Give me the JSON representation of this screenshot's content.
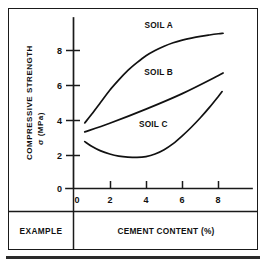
{
  "figure": {
    "caption_cell": "EXAMPLE",
    "border_color": "#1a1a1a",
    "line_color": "#111111",
    "background_color": "#ffffff"
  },
  "chart_data": {
    "type": "line",
    "title": "",
    "xlabel": "CEMENT CONTENT (%)",
    "ylabel": "COMPRESSIVE STRENGTH",
    "ylabel_symbol": "σ (MPa)",
    "xlim": [
      0,
      9.3
    ],
    "ylim": [
      0,
      9.7
    ],
    "xticks": [
      0,
      2,
      4,
      6,
      8
    ],
    "xtick_labels": [
      "0",
      "2",
      "4",
      "6",
      "8"
    ],
    "yticks": [
      0,
      2,
      4,
      6,
      8
    ],
    "ytick_labels": [
      "0",
      "2",
      "4",
      "6",
      "8"
    ],
    "grid": false,
    "legend_position": "inline-annotations",
    "series": [
      {
        "name": "SOIL A",
        "label": "SOIL A",
        "label_x": 4.7,
        "label_y": 9.3,
        "x": [
          0.62,
          1.0,
          1.5,
          2.0,
          2.5,
          3.0,
          3.5,
          4.0,
          4.5,
          5.0,
          5.5,
          6.0,
          6.5,
          7.0,
          7.5,
          8.0,
          8.25
        ],
        "y": [
          3.8,
          4.3,
          5.0,
          5.7,
          6.3,
          6.85,
          7.3,
          7.7,
          8.0,
          8.25,
          8.45,
          8.6,
          8.72,
          8.82,
          8.9,
          8.97,
          9.0
        ]
      },
      {
        "name": "SOIL B",
        "label": "SOIL B",
        "label_x": 4.7,
        "label_y": 6.6,
        "x": [
          0.62,
          2.0,
          4.0,
          6.0,
          8.0,
          8.25
        ],
        "y": [
          3.28,
          3.78,
          4.6,
          5.5,
          6.55,
          6.7
        ]
      },
      {
        "name": "SOIL C",
        "label": "SOIL C",
        "label_x": 4.4,
        "label_y": 3.55,
        "x": [
          0.62,
          1.0,
          1.5,
          2.0,
          2.5,
          3.0,
          3.5,
          4.0,
          4.5,
          5.0,
          5.5,
          6.0,
          6.5,
          7.0,
          7.5,
          8.0,
          8.2
        ],
        "y": [
          2.72,
          2.45,
          2.18,
          2.0,
          1.88,
          1.82,
          1.8,
          1.85,
          2.0,
          2.25,
          2.6,
          3.05,
          3.55,
          4.1,
          4.7,
          5.35,
          5.62
        ]
      }
    ]
  }
}
